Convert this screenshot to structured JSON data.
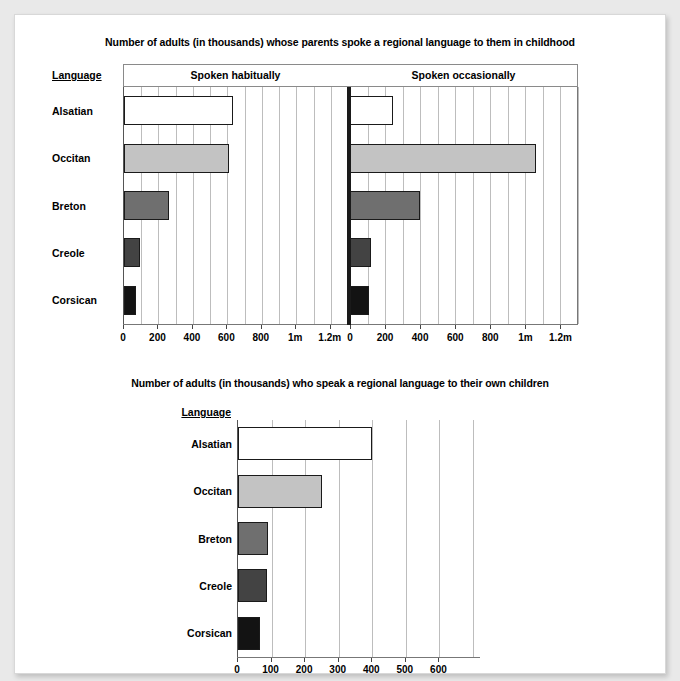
{
  "page": {
    "background": "#e9e9e9",
    "card_background": "#ffffff"
  },
  "chart_data": [
    {
      "type": "bar",
      "id": "parents-spoke",
      "title": "Number of adults (in thousands) whose parents spoke a regional language to them in childhood",
      "orientation": "horizontal",
      "row_header_label": "Language",
      "categories": [
        "Alsatian",
        "Occitan",
        "Breton",
        "Creole",
        "Corsican"
      ],
      "series": [
        {
          "name": "Spoken habitually",
          "values": [
            630,
            610,
            260,
            95,
            70
          ]
        },
        {
          "name": "Spoken occasionally",
          "values": [
            245,
            1060,
            400,
            120,
            110
          ]
        }
      ],
      "xlabel": "",
      "ylabel": "Language",
      "xlim": [
        0,
        1300
      ],
      "tick_values": [
        0,
        200,
        400,
        600,
        800,
        1000,
        1200
      ],
      "tick_labels": [
        "0",
        "200",
        "400",
        "600",
        "800",
        "1m",
        "1.2m"
      ],
      "gridline_step": 100,
      "grid": true,
      "legend": "none",
      "bar_colors": [
        "#ffffff",
        "#c3c3c3",
        "#6f6f6f",
        "#434343",
        "#131313"
      ]
    },
    {
      "type": "bar",
      "id": "own-children",
      "title": "Number of adults (in thousands) who speak a regional language to their own children",
      "orientation": "horizontal",
      "row_header_label": "Language",
      "categories": [
        "Alsatian",
        "Occitan",
        "Breton",
        "Creole",
        "Corsican"
      ],
      "values": [
        400,
        250,
        90,
        85,
        65
      ],
      "xlabel": "",
      "ylabel": "Language",
      "xlim": [
        0,
        700
      ],
      "tick_values": [
        0,
        100,
        200,
        300,
        400,
        500,
        600
      ],
      "tick_labels": [
        "0",
        "100",
        "200",
        "300",
        "400",
        "500",
        "600"
      ],
      "gridline_step": 100,
      "grid": true,
      "legend": "none",
      "bar_colors": [
        "#ffffff",
        "#c3c3c3",
        "#6f6f6f",
        "#434343",
        "#131313"
      ]
    }
  ]
}
